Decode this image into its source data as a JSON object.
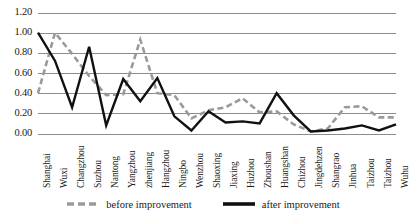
{
  "chart_data": {
    "type": "line",
    "title": "",
    "subtitle": "",
    "xlabel": "",
    "ylabel": "",
    "ylim": [
      0.0,
      1.2
    ],
    "yticks": [
      "0.00",
      "0.20",
      "0.40",
      "0.60",
      "0.80",
      "1.00",
      "1.20"
    ],
    "ytick_values": [
      0.0,
      0.2,
      0.4,
      0.6,
      0.8,
      1.0,
      1.2
    ],
    "grid": true,
    "legend_position": "bottom",
    "categories": [
      "Shanghai",
      "Wuxi",
      "Changzhou",
      "Suzhou",
      "Nantong",
      "Yangzhou",
      "zhenjiang",
      "Hangzhou",
      "Ningbo",
      "Wenzhou",
      "Shaoxing",
      "Jiaxing",
      "Huzhou",
      "Zhoushan",
      "Huangshan",
      "Chizhou",
      "Jingdehzen",
      "Shangrao",
      "Jinhua",
      "Taizhou",
      "Taizhou",
      "Wuhu"
    ],
    "series": [
      {
        "name": "before improvement",
        "style": "dashed",
        "color": "#9a9a9a",
        "values": [
          0.4,
          1.0,
          0.79,
          0.57,
          0.38,
          0.39,
          0.93,
          0.4,
          0.38,
          0.15,
          0.23,
          0.26,
          0.35,
          0.21,
          0.22,
          0.09,
          0.02,
          0.05,
          0.26,
          0.27,
          0.16,
          0.16
        ]
      },
      {
        "name": "after improvement",
        "style": "solid",
        "color": "#111111",
        "values": [
          1.0,
          0.72,
          0.26,
          0.86,
          0.08,
          0.54,
          0.32,
          0.55,
          0.17,
          0.03,
          0.22,
          0.11,
          0.12,
          0.1,
          0.4,
          0.18,
          0.02,
          0.03,
          0.05,
          0.08,
          0.03,
          0.09
        ]
      }
    ]
  },
  "legend": {
    "items": [
      {
        "label": "before improvement",
        "marker": "dashed-line-marker"
      },
      {
        "label": "after improvement",
        "marker": "solid-line-marker"
      }
    ]
  },
  "colors": {
    "before_improvement": "#9a9a9a",
    "after_improvement": "#111111",
    "gridline": "#8c8c8c",
    "text": "#1a1a1a",
    "background": "#ffffff"
  }
}
